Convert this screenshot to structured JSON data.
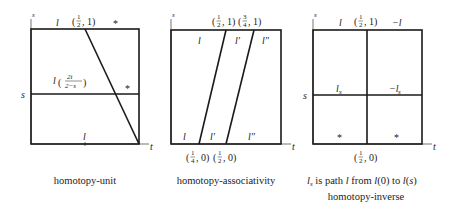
{
  "diagrams": [
    {
      "id": "homotopy-unit",
      "caption": "homotopy-unit",
      "axis_labels": {
        "vertical": "s",
        "horizontal": "t"
      },
      "labels": {
        "top_left": "l",
        "top_point_open": "(",
        "top_point_num": "1",
        "top_point_den": "2",
        "top_point_close": ", 1)",
        "top_right": "*",
        "middle_l": "l",
        "middle_num": "2t",
        "middle_den": "2−s",
        "middle_right": "*",
        "left_s": "s",
        "bottom": "l"
      }
    },
    {
      "id": "homotopy-associativity",
      "caption": "homotopy-associativity",
      "axis_labels": {
        "vertical": "s",
        "horizontal": "t",
        "left_t": "t"
      },
      "labels": {
        "top_point1_num": "1",
        "top_point1_den": "2",
        "top_point2_num": "3",
        "top_point2_den": "4",
        "top_segments": [
          "l",
          "l′",
          "l″"
        ],
        "bottom_segments": [
          "l",
          "l′",
          "l″"
        ],
        "bottom_point1_num": "1",
        "bottom_point1_den": "4",
        "bottom_point2_num": "1",
        "bottom_point2_den": "2",
        "coord_tail_top": ", 1)",
        "coord_tail_bottom": ", 0)",
        "paren_open": "("
      }
    },
    {
      "id": "homotopy-inverse",
      "caption_line1_sub": "s",
      "caption_line1_l": "l",
      "caption_line1_rest": " is path ",
      "caption_line1_l2": "l",
      "caption_line1_from": " from ",
      "caption_line1_l0": "l",
      "caption_line1_zero": "(0) to ",
      "caption_line1_ls": "l",
      "caption_line1_s_open": "(",
      "caption_line1_s": "s",
      "caption_line1_s_close": ")",
      "caption": "homotopy-inverse",
      "axis_labels": {
        "vertical": "s",
        "horizontal": "t"
      },
      "labels": {
        "top_left": "l",
        "top_right": "−l",
        "top_point_num": "1",
        "top_point_den": "2",
        "top_point_tail": ", 1)",
        "mid_left": "l",
        "mid_left_sub": "s",
        "mid_right": "−l",
        "mid_right_sub": "s",
        "left_s": "s",
        "bottom_left": "*",
        "bottom_right": "*",
        "bottom_point_num": "1",
        "bottom_point_den": "2",
        "bottom_point_tail": ", 0)",
        "paren_open": "("
      }
    }
  ]
}
